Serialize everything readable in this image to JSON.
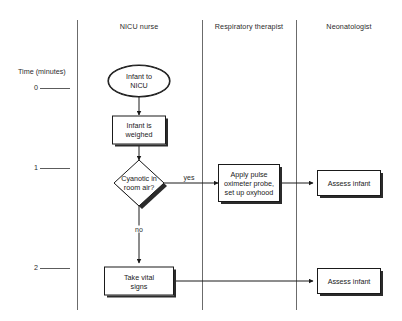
{
  "diagram": {
    "axis": {
      "label": "Time (minutes)",
      "ticks": [
        {
          "value": "0",
          "y": 88
        },
        {
          "value": "1",
          "y": 168
        },
        {
          "value": "2",
          "y": 268
        }
      ]
    },
    "lanes": [
      {
        "id": "nicu-nurse",
        "label": "NICU nurse",
        "center_x": 139
      },
      {
        "id": "respiratory-therapist",
        "label": "Respiratory therapist",
        "center_x": 249
      },
      {
        "id": "neonatologist",
        "label": "Neonatologist",
        "center_x": 349
      }
    ],
    "nodes": [
      {
        "id": "infant-to-nicu",
        "shape": "terminator",
        "lines": [
          "Infant to",
          "NICU"
        ],
        "lane": "nicu-nurse"
      },
      {
        "id": "infant-is-weighed",
        "shape": "process",
        "lines": [
          "Infant is",
          "weighed"
        ],
        "lane": "nicu-nurse"
      },
      {
        "id": "cyanotic-in-room-air",
        "shape": "decision",
        "lines": [
          "Cyanotic in",
          "room air?"
        ],
        "lane": "nicu-nurse"
      },
      {
        "id": "apply-pulse-oximeter",
        "shape": "process",
        "lines": [
          "Apply pulse",
          "oximeter probe,",
          "set up oxyhood"
        ],
        "lane": "respiratory-therapist"
      },
      {
        "id": "assess-infant-1",
        "shape": "process",
        "lines": [
          "Assess infant"
        ],
        "lane": "neonatologist"
      },
      {
        "id": "take-vital-signs",
        "shape": "process",
        "lines": [
          "Take vital",
          "signs"
        ],
        "lane": "nicu-nurse"
      },
      {
        "id": "assess-infant-2",
        "shape": "process",
        "lines": [
          "Assess infant"
        ],
        "lane": "neonatologist"
      }
    ],
    "edge_labels": [
      {
        "id": "yes",
        "text": "yes"
      },
      {
        "id": "no",
        "text": "no"
      }
    ],
    "colors": {
      "stroke": "#1a1a1a",
      "lane_divider": "#6b6b6b",
      "shadow": "#2b2b2b",
      "background": "#ffffff",
      "text": "#1a1a1a"
    }
  }
}
